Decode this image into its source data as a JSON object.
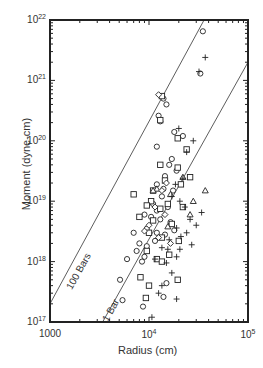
{
  "chart_data": {
    "type": "scatter",
    "title": "",
    "xlabel": "Radius (cm)",
    "ylabel": "Moment (dyne-cm)",
    "xscale": "log",
    "yscale": "log",
    "xlim": [
      1000,
      100000
    ],
    "ylim": [
      1e+17,
      1e+22
    ],
    "x_ticks": [
      {
        "value": 1000,
        "label": "1000"
      },
      {
        "value": 10000,
        "label": "10^4"
      },
      {
        "value": 100000,
        "label": "10^5"
      }
    ],
    "y_ticks": [
      {
        "value": 1e+17,
        "label": "10^17"
      },
      {
        "value": 1e+18,
        "label": "10^18"
      },
      {
        "value": 1e+19,
        "label": "10^19"
      },
      {
        "value": 1e+20,
        "label": "10^20"
      },
      {
        "value": 1e+21,
        "label": "10^21"
      },
      {
        "value": 1e+22,
        "label": "10^22"
      }
    ],
    "grid": false,
    "legend": null,
    "reference_lines": [
      {
        "label": "100 Bars",
        "points": [
          [
            1000,
            2e+17
          ],
          [
            36000,
            1e+22
          ]
        ]
      },
      {
        "label": "1 Bar",
        "points": [
          [
            3400,
            1e+17
          ],
          [
            100000,
            2e+21
          ]
        ]
      }
    ],
    "series": [
      {
        "name": "circle",
        "marker": "o",
        "points": [
          [
            35000,
            6.5e+21
          ],
          [
            33000,
            1.3e+21
          ],
          [
            14000,
            5e+20
          ],
          [
            15000,
            4e+20
          ],
          [
            12500,
            2.6e+20
          ],
          [
            13000,
            2.1e+20
          ],
          [
            18000,
            1.4e+20
          ],
          [
            22000,
            1.2e+20
          ],
          [
            12000,
            8e+19
          ],
          [
            17000,
            5e+19
          ],
          [
            16000,
            4e+19
          ],
          [
            19000,
            3.2e+19
          ],
          [
            14500,
            2.6e+19
          ],
          [
            12000,
            1.9e+19
          ],
          [
            14000,
            1.6e+19
          ],
          [
            17500,
            1.5e+19
          ],
          [
            13500,
            1.2e+19
          ],
          [
            11000,
            9e+18
          ],
          [
            15500,
            8e+18
          ],
          [
            12000,
            7e+18
          ],
          [
            9000,
            6e+18
          ],
          [
            10500,
            5.5e+18
          ],
          [
            13000,
            5e+18
          ],
          [
            16500,
            4.5e+18
          ],
          [
            7000,
            3e+18
          ],
          [
            9500,
            3.5e+18
          ],
          [
            12000,
            3e+18
          ],
          [
            14500,
            2.8e+18
          ],
          [
            18000,
            3.3e+18
          ],
          [
            8000,
            2e+18
          ],
          [
            9500,
            1.8e+18
          ],
          [
            11500,
            2.2e+18
          ],
          [
            7500,
            1.5e+18
          ],
          [
            9000,
            1.2e+18
          ],
          [
            6000,
            1.1e+18
          ],
          [
            8500,
            1e+18
          ],
          [
            5100,
            5e+17
          ],
          [
            5400,
            2.3e+17
          ],
          [
            8700,
            1.8e+17
          ],
          [
            14000,
            2.6e+17
          ],
          [
            15000,
            4.4e+17
          ]
        ]
      },
      {
        "name": "square",
        "marker": "s",
        "points": [
          [
            13500,
            5.5e+20
          ],
          [
            13000,
            2.2e+20
          ],
          [
            19500,
            1.1e+20
          ],
          [
            24000,
            7.2e+19
          ],
          [
            13000,
            4e+19
          ],
          [
            19500,
            3.6e+19
          ],
          [
            26000,
            2.5e+19
          ],
          [
            14500,
            2.2e+19
          ],
          [
            21000,
            1.9e+19
          ],
          [
            11000,
            1.5e+19
          ],
          [
            7000,
            1.3e+19
          ],
          [
            10500,
            1e+19
          ],
          [
            15500,
            9e+18
          ],
          [
            9500,
            8.5e+18
          ],
          [
            13000,
            7.5e+18
          ],
          [
            22000,
            8e+18
          ],
          [
            8000,
            5.5e+18
          ],
          [
            11000,
            4.8e+18
          ],
          [
            17000,
            4.2e+18
          ],
          [
            10000,
            3e+18
          ],
          [
            13500,
            2.5e+18
          ],
          [
            20000,
            2.2e+18
          ],
          [
            9500,
            1.5e+18
          ],
          [
            16000,
            1.3e+18
          ],
          [
            12000,
            1.1e+18
          ],
          [
            8200,
            5.5e+17
          ],
          [
            10000,
            4e+17
          ],
          [
            9300,
            2.5e+17
          ],
          [
            19500,
            5e+17
          ],
          [
            13500,
            1e+18
          ]
        ]
      },
      {
        "name": "triangle",
        "marker": "^",
        "points": [
          [
            37000,
            1.5e+19
          ],
          [
            28000,
            1e+19
          ],
          [
            16500,
            1.3e+19
          ],
          [
            26000,
            6e+18
          ],
          [
            15500,
            3.8e+18
          ],
          [
            12000,
            1.6e+19
          ],
          [
            11000,
            1.5e+19
          ],
          [
            22000,
            2.5e+19
          ]
        ]
      },
      {
        "name": "plus",
        "marker": "+",
        "points": [
          [
            37000,
            2.4e+21
          ],
          [
            32000,
            1.4e+21
          ],
          [
            20000,
            1.6e+20
          ],
          [
            24000,
            6.5e+19
          ],
          [
            22000,
            2.4e+19
          ],
          [
            28000,
            1e+20
          ],
          [
            18500,
            1.9e+19
          ],
          [
            17000,
            1.2e+19
          ],
          [
            20500,
            1e+19
          ],
          [
            23000,
            8e+18
          ],
          [
            26000,
            5e+18
          ],
          [
            19000,
            3.6e+18
          ],
          [
            24000,
            3e+18
          ],
          [
            16000,
            2.3e+18
          ],
          [
            21000,
            2.6e+18
          ],
          [
            27000,
            1.9e+18
          ],
          [
            13500,
            1.7e+18
          ],
          [
            15500,
            1.6e+18
          ],
          [
            19000,
            1.2e+18
          ],
          [
            11500,
            1.1e+18
          ],
          [
            15000,
            9.5e+17
          ],
          [
            17000,
            6.5e+17
          ],
          [
            13500,
            4e+17
          ],
          [
            12500,
            3e+17
          ],
          [
            19000,
            2.4e+17
          ],
          [
            10700,
            1.2e+17
          ],
          [
            30000,
            4e+18
          ],
          [
            34000,
            6.5e+18
          ],
          [
            20500,
            1.6e+18
          ]
        ]
      },
      {
        "name": "diamond",
        "marker": "d",
        "points": [
          [
            12500,
            5.8e+20
          ],
          [
            13500,
            1.5e+19
          ],
          [
            15000,
            2e+19
          ],
          [
            11500,
            8e+18
          ],
          [
            14500,
            6e+18
          ],
          [
            10000,
            4e+18
          ],
          [
            12500,
            2.5e+18
          ],
          [
            16500,
            2e+18
          ],
          [
            9000,
            3.2e+18
          ]
        ]
      }
    ]
  }
}
